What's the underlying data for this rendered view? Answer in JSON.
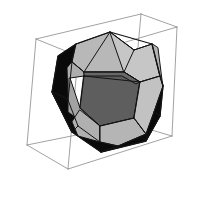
{
  "figure": {
    "title": "Regular dodecahedron inscribed in a wireframe bounding cube",
    "background_color": "#ffffff",
    "width": 201,
    "height": 202,
    "solid_name": "dodecahedron",
    "face_count": 12,
    "vertex_count": 20,
    "edge_count": 30,
    "bounding_box_label": "wireframe cube",
    "palette": {
      "background": "#ffffff",
      "wire": "#8a8a8a",
      "outline": "#141414",
      "face_black": "#0a0a0a",
      "face_dark": "#3a3a3a",
      "face_mid": "#6e6e6e",
      "face_light": "#a8a8a8",
      "face_lighter": "#bdbdbd",
      "face_pale": "#cfcfcf"
    },
    "stroke_widths": {
      "wire": 0.8,
      "face": 1.0
    }
  },
  "chart_data": {
    "type": "scatter",
    "title": "Regular dodecahedron inscribed in a wireframe bounding cube",
    "xlabel": "",
    "ylabel": "",
    "grid": false,
    "legend": null,
    "projection": "oblique 3D perspective, viewer above-left",
    "cube": {
      "name": "bounding-cube",
      "stroke": "#8a8a8a",
      "stroke_width": 0.8,
      "vertices_2d": {
        "back_top_left": [
          36,
          39
        ],
        "back_top_right": [
          141,
          14
        ],
        "front_top_right": [
          177,
          27
        ],
        "front_top_left": [
          78,
          56
        ],
        "back_bottom_left": [
          27,
          145
        ],
        "back_bottom_right": [
          131,
          124
        ],
        "front_bottom_right": [
          172,
          136
        ],
        "front_bottom_left": [
          68,
          169
        ]
      },
      "edges": [
        [
          "back_top_left",
          "back_top_right"
        ],
        [
          "back_top_right",
          "front_top_right"
        ],
        [
          "front_top_right",
          "front_top_left"
        ],
        [
          "front_top_left",
          "back_top_left"
        ],
        [
          "back_bottom_left",
          "back_bottom_right"
        ],
        [
          "back_bottom_right",
          "front_bottom_right"
        ],
        [
          "front_bottom_right",
          "front_bottom_left"
        ],
        [
          "front_bottom_left",
          "back_bottom_left"
        ],
        [
          "back_top_left",
          "back_bottom_left"
        ],
        [
          "back_top_right",
          "back_bottom_right"
        ],
        [
          "front_top_right",
          "front_bottom_right"
        ],
        [
          "front_top_left",
          "front_bottom_left"
        ]
      ]
    },
    "solid": {
      "name": "dodecahedron",
      "outline_stroke": "#141414",
      "faces": [
        {
          "id": "face-left-silhouette",
          "shade": "black",
          "fill": "#0a0a0a",
          "points": "52,92 58,56 76,44 84,50 72,62 68,100 80,128 72,132"
        },
        {
          "id": "face-lower-left-silhouette",
          "shade": "black",
          "fill": "#0a0a0a",
          "points": "52,92 72,132 101,152 120,147 101,142 78,126 66,98"
        },
        {
          "id": "face-bottom-silhouette",
          "shade": "black",
          "fill": "#0a0a0a",
          "points": "101,152 146,141 160,116 152,110 146,134 118,146"
        },
        {
          "id": "face-right-silhouette",
          "shade": "black",
          "fill": "#0a0a0a",
          "points": "146,141 160,116 163,86 155,80 154,112 140,135"
        },
        {
          "id": "face-top-left-light",
          "shade": "light",
          "fill": "#b8b8b8",
          "points": "76,44 110,32 134,50 124,72 84,72 72,62"
        },
        {
          "id": "face-top-right-pale",
          "shade": "pale",
          "fill": "#c6c6c6",
          "points": "110,32 134,50 152,44 160,76 140,82 124,72"
        },
        {
          "id": "face-upper-left-mid",
          "shade": "light",
          "fill": "#aeaeae",
          "points": "72,62 84,72 84,76 70,78 68,100 67,68"
        },
        {
          "id": "face-center-dark",
          "shade": "dark",
          "fill": "#5e5e5e",
          "points": "84,76 124,72 140,82 134,118 100,126 80,108"
        },
        {
          "id": "face-center-upper-dark",
          "shade": "dark",
          "fill": "#686868",
          "points": "84,72 124,72 140,82 136,84 122,76 85,76"
        },
        {
          "id": "face-left-mid",
          "shade": "mid",
          "fill": "#a2a2a2",
          "points": "70,78 80,108 100,126 96,132 68,112 68,80"
        },
        {
          "id": "face-bottom-left-light",
          "shade": "light",
          "fill": "#b0b0b0",
          "points": "80,110 100,126 100,142 78,136 72,122"
        },
        {
          "id": "face-bottom-center-light",
          "shade": "light",
          "fill": "#b5b5b5",
          "points": "100,126 134,118 146,134 118,146 100,142"
        },
        {
          "id": "face-right-pale",
          "shade": "pale",
          "fill": "#c2c2c2",
          "points": "140,82 160,76 163,86 154,112 146,134 134,118"
        },
        {
          "id": "face-right-upper-light",
          "shade": "light",
          "fill": "#b4b4b4",
          "points": "152,44 160,76 163,86 162,80 158,48"
        }
      ],
      "outline_polygon": "110,32 152,44 160,76 163,86 160,116 146,141 101,152 72,132 52,92 58,56 76,44",
      "internal_edges": [
        "76,44 72,62",
        "72,62 84,72",
        "84,72 110,32",
        "110,32 134,50",
        "134,50 124,72",
        "124,72 84,72",
        "134,50 152,44",
        "124,72 140,82",
        "140,82 160,76",
        "72,62 68,100",
        "68,100 52,92",
        "84,76 80,108",
        "80,108 100,126",
        "100,126 134,118",
        "134,118 140,82",
        "140,82 84,76",
        "68,100 78,126",
        "78,126 72,132",
        "78,126 100,142",
        "100,142 100,126",
        "100,142 118,146",
        "118,146 101,152",
        "118,146 146,134",
        "146,134 146,141",
        "146,134 154,112",
        "154,112 160,116",
        "154,112 163,86",
        "134,118 146,134"
      ]
    }
  }
}
